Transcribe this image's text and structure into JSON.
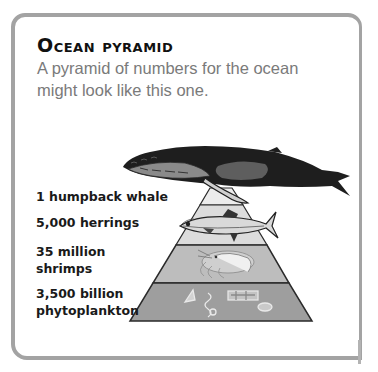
{
  "title": "Ocean pyramid",
  "intro": {
    "line1": "A pyramid of numbers for the ocean",
    "line2": "might look like this one."
  },
  "pyramid": {
    "levels": [
      {
        "count_line1": "1 humpback whale",
        "count_line2": "",
        "organism": "humpback whale",
        "fill": "#ececec"
      },
      {
        "count_line1": "5,000 herrings",
        "count_line2": "",
        "organism": "herring",
        "fill": "#dcdcdc"
      },
      {
        "count_line1": "35 million",
        "count_line2": "shrimps",
        "organism": "shrimp",
        "fill": "#bdbdbd"
      },
      {
        "count_line1": "3,500 billion",
        "count_line2": "phytoplankton",
        "organism": "phytoplankton",
        "fill": "#9e9e9e"
      }
    ],
    "outline_color": "#2a2a2a"
  },
  "colors": {
    "frame": "#a3a3a3",
    "title": "#111111",
    "intro": "#7a7a7a",
    "label": "#1a1a1a"
  }
}
